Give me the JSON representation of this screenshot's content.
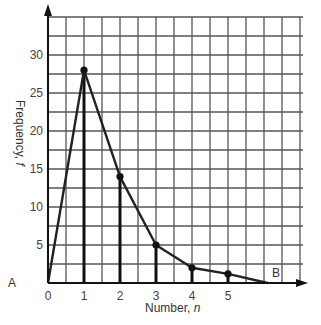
{
  "chart_data": {
    "type": "line",
    "title": "",
    "xlabel": "Number, n",
    "ylabel": "Frequency, f",
    "x": [
      0,
      1,
      2,
      3,
      4,
      5,
      6.1
    ],
    "values": [
      0,
      28,
      14,
      5,
      2,
      1.2,
      0
    ],
    "markers": [
      {
        "x": 1,
        "y": 28
      },
      {
        "x": 2,
        "y": 14
      },
      {
        "x": 3,
        "y": 5
      },
      {
        "x": 4,
        "y": 2
      },
      {
        "x": 5,
        "y": 1.2
      }
    ],
    "stems": [
      1,
      2,
      3,
      4,
      5
    ],
    "xticks": [
      "0",
      "1",
      "2",
      "3",
      "4",
      "5"
    ],
    "yticks": [
      "5",
      "10",
      "15",
      "20",
      "25",
      "30"
    ],
    "xlim": [
      0,
      7
    ],
    "ylim": [
      0,
      35
    ],
    "grid": true,
    "annotations": [
      {
        "text": "A",
        "x": 0,
        "y": 0
      },
      {
        "text": "B",
        "x": 6.1,
        "y": 0
      }
    ]
  },
  "labels": {
    "xlabel_main": "Number, ",
    "xlabel_var": "n",
    "ylabel_main": "Frequency, ",
    "ylabel_var": "f",
    "point_a": "A",
    "point_b": "B"
  }
}
